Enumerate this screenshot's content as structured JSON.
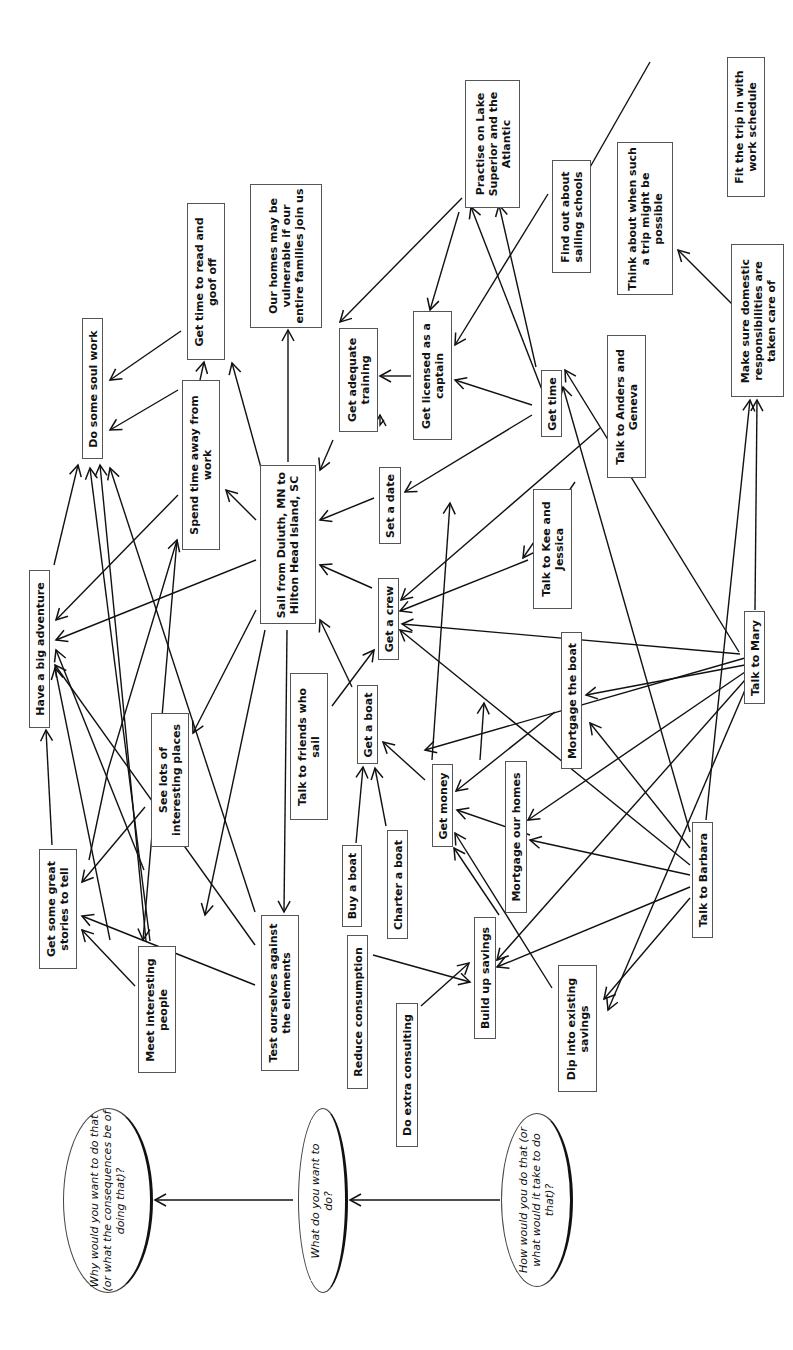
{
  "diagram": {
    "type": "means-ends goal map (rotated 90 degrees)",
    "legend": [
      {
        "id": "q_why",
        "text": "Why would you want to do that (or what the consequences be of doing that)?",
        "box": [
          63,
          1108,
          90,
          185
        ],
        "wrap": 185
      },
      {
        "id": "q_what",
        "text": "What do you want to do?",
        "box": [
          298,
          1108,
          50,
          185
        ],
        "wrap": 120
      },
      {
        "id": "q_how",
        "text": "How would you do that (or what would it take to do that)?",
        "box": [
          501,
          1113,
          72,
          174
        ],
        "wrap": 150
      }
    ],
    "nodes": [
      {
        "id": "adventure",
        "text": "Have a big adventure",
        "box": [
          29,
          570,
          21,
          158
        ],
        "wrap": 160
      },
      {
        "id": "soul",
        "text": "Do some soul work",
        "box": [
          82,
          318,
          21,
          141
        ],
        "wrap": 140
      },
      {
        "id": "read",
        "text": "Get time to read and goof off",
        "box": [
          187,
          203,
          38,
          157
        ],
        "wrap": 140
      },
      {
        "id": "homes_vuln",
        "text": "Our homes may be vulnerable if our entire families join us",
        "box": [
          250,
          184,
          72,
          144
        ],
        "wrap": 140
      },
      {
        "id": "away",
        "text": "Spend time away from work",
        "box": [
          182,
          380,
          38,
          170
        ],
        "wrap": 160
      },
      {
        "id": "sail",
        "text": "Sail from Duluth, MN to Hilton Head Island, SC",
        "box": [
          260,
          465,
          56,
          159
        ],
        "wrap": 150
      },
      {
        "id": "training",
        "text": "Get adequate training",
        "box": [
          339,
          328,
          39,
          104
        ],
        "wrap": 95
      },
      {
        "id": "practise",
        "text": "Practise on Lake Superior and the Atlantic",
        "box": [
          465,
          80,
          55,
          128
        ],
        "wrap": 125
      },
      {
        "id": "schools",
        "text": "Find out about sailing schools",
        "box": [
          552,
          160,
          39,
          113
        ],
        "wrap": 110
      },
      {
        "id": "think",
        "text": "Think about when such a trip might be possible",
        "box": [
          617,
          142,
          56,
          153
        ],
        "wrap": 145
      },
      {
        "id": "fit",
        "text": "Fit the trip in with work schedule",
        "box": [
          727,
          57,
          38,
          140
        ],
        "wrap": 130
      },
      {
        "id": "domestic",
        "text": "Make sure domestic responsibilities are taken care of",
        "box": [
          731,
          244,
          53,
          153
        ],
        "wrap": 145
      },
      {
        "id": "licensed",
        "text": "Get licensed as a captain",
        "box": [
          413,
          311,
          39,
          129
        ],
        "wrap": 110
      },
      {
        "id": "time",
        "text": "Get time",
        "box": [
          541,
          370,
          21,
          67
        ],
        "wrap": 65
      },
      {
        "id": "date",
        "text": "Set a date",
        "box": [
          379,
          467,
          22,
          77
        ],
        "wrap": 75
      },
      {
        "id": "anders",
        "text": "Talk to Anders and Geneva",
        "box": [
          607,
          335,
          39,
          143
        ],
        "wrap": 130
      },
      {
        "id": "kee",
        "text": "Talk to Kee and Jessica",
        "box": [
          533,
          489,
          39,
          120
        ],
        "wrap": 110
      },
      {
        "id": "crew",
        "text": "Get a crew",
        "box": [
          378,
          578,
          21,
          82
        ],
        "wrap": 80
      },
      {
        "id": "friends",
        "text": "Talk to friends who sail",
        "box": [
          290,
          673,
          38,
          147
        ],
        "wrap": 130
      },
      {
        "id": "boat",
        "text": "Get a boat",
        "box": [
          357,
          685,
          21,
          79
        ],
        "wrap": 78
      },
      {
        "id": "mort_boat",
        "text": "Mortgage the boat",
        "box": [
          561,
          632,
          21,
          137
        ],
        "wrap": 135
      },
      {
        "id": "mary",
        "text": "Talk to Mary",
        "box": [
          744,
          611,
          21,
          93
        ],
        "wrap": 90
      },
      {
        "id": "money",
        "text": "Get money",
        "box": [
          432,
          764,
          21,
          83
        ],
        "wrap": 80
      },
      {
        "id": "mort_homes",
        "text": "Mortgage our homes",
        "box": [
          505,
          761,
          22,
          152
        ],
        "wrap": 150
      },
      {
        "id": "buy",
        "text": "Buy a boat",
        "box": [
          342,
          845,
          20,
          82
        ],
        "wrap": 80
      },
      {
        "id": "charter",
        "text": "Charter a boat",
        "box": [
          387,
          830,
          21,
          109
        ],
        "wrap": 108
      },
      {
        "id": "reduce",
        "text": "Reduce consumption",
        "box": [
          347,
          935,
          21,
          154
        ],
        "wrap": 152
      },
      {
        "id": "savings",
        "text": "Build up savings",
        "box": [
          474,
          917,
          22,
          122
        ],
        "wrap": 120
      },
      {
        "id": "consult",
        "text": "Do extra consulting",
        "box": [
          396,
          1003,
          22,
          144
        ],
        "wrap": 142
      },
      {
        "id": "dip",
        "text": "Dip into existing savings",
        "box": [
          558,
          965,
          39,
          127
        ],
        "wrap": 125
      },
      {
        "id": "barbara",
        "text": "Talk to Barbara",
        "box": [
          692,
          822,
          21,
          116
        ],
        "wrap": 115
      },
      {
        "id": "stories",
        "text": "Get some great stories to tell",
        "box": [
          39,
          849,
          38,
          120
        ],
        "wrap": 118
      },
      {
        "id": "places",
        "text": "See lots of interesting places",
        "box": [
          151,
          713,
          38,
          134
        ],
        "wrap": 130
      },
      {
        "id": "people",
        "text": "Meet interesting people",
        "box": [
          138,
          946,
          38,
          127
        ],
        "wrap": 125
      },
      {
        "id": "test",
        "text": "Test ourselves against the elements",
        "box": [
          261,
          915,
          38,
          156
        ],
        "wrap": 155
      }
    ],
    "edges": [
      [
        [
          293,
          1200
        ],
        [
          155,
          1200
        ]
      ],
      [
        [
          500,
          1200
        ],
        [
          350,
          1200
        ]
      ],
      [
        [
          181,
          331
        ],
        [
          110,
          380
        ]
      ],
      [
        [
          178,
          390
        ],
        [
          110,
          430
        ]
      ],
      [
        [
          178,
          495
        ],
        [
          56,
          620
        ]
      ],
      [
        [
          54,
          565
        ],
        [
          78,
          465
        ]
      ],
      [
        [
          200,
          380
        ],
        [
          204,
          362
        ]
      ],
      [
        [
          263,
          475
        ],
        [
          232,
          363
        ]
      ],
      [
        [
          256,
          520
        ],
        [
          226,
          490
        ]
      ],
      [
        [
          288,
          462
        ],
        [
          288,
          330
        ]
      ],
      [
        [
          256,
          560
        ],
        [
          56,
          640
        ]
      ],
      [
        [
          256,
          610
        ],
        [
          193,
          733
        ]
      ],
      [
        [
          265,
          630
        ],
        [
          205,
          915
        ]
      ],
      [
        [
          287,
          630
        ],
        [
          284,
          912
        ]
      ],
      [
        [
          333,
          440
        ],
        [
          320,
          470
        ]
      ],
      [
        [
          374,
          498
        ],
        [
          320,
          520
        ]
      ],
      [
        [
          372,
          588
        ],
        [
          320,
          565
        ]
      ],
      [
        [
          352,
          687
        ],
        [
          320,
          620
        ]
      ],
      [
        [
          332,
          706
        ],
        [
          374,
          650
        ]
      ],
      [
        [
          384,
          420
        ],
        [
          380,
          425
        ],
        [
          380,
          415
        ]
      ],
      [
        [
          411,
          376
        ],
        [
          380,
          376
        ]
      ],
      [
        [
          459,
          212
        ],
        [
          430,
          310
        ]
      ],
      [
        [
          462,
          198
        ],
        [
          340,
          322
        ]
      ],
      [
        [
          548,
          194
        ],
        [
          455,
          345
        ]
      ],
      [
        [
          536,
          367
        ],
        [
          499,
          205
        ]
      ],
      [
        [
          532,
          405
        ],
        [
          455,
          380
        ]
      ],
      [
        [
          532,
          415
        ],
        [
          405,
          492
        ]
      ],
      [
        [
          575,
          482
        ],
        [
          523,
          558
        ]
      ],
      [
        [
          650,
          62
        ],
        [
          577,
          190
        ]
      ],
      [
        [
          733,
          305
        ],
        [
          678,
          250
        ]
      ],
      [
        [
          551,
          413
        ],
        [
          471,
          207
        ]
      ],
      [
        [
          600,
          428
        ],
        [
          401,
          600
        ]
      ],
      [
        [
          528,
          560
        ],
        [
          400,
          611
        ]
      ],
      [
        [
          740,
          654
        ],
        [
          402,
          624
        ]
      ],
      [
        [
          739,
          652
        ],
        [
          565,
          370
        ]
      ],
      [
        [
          745,
          658
        ],
        [
          425,
          750
        ]
      ],
      [
        [
          745,
          665
        ],
        [
          586,
          695
        ]
      ],
      [
        [
          745,
          672
        ],
        [
          528,
          820
        ]
      ],
      [
        [
          745,
          680
        ],
        [
          497,
          960
        ]
      ],
      [
        [
          745,
          690
        ],
        [
          608,
          1010
        ]
      ],
      [
        [
          755,
          610
        ],
        [
          757,
          400
        ]
      ],
      [
        [
          706,
          820
        ],
        [
          750,
          400
        ]
      ],
      [
        [
          690,
          832
        ],
        [
          563,
          387
        ]
      ],
      [
        [
          690,
          848
        ],
        [
          590,
          723
        ]
      ],
      [
        [
          690,
          865
        ],
        [
          400,
          630
        ]
      ],
      [
        [
          690,
          875
        ],
        [
          530,
          840
        ]
      ],
      [
        [
          690,
          887
        ],
        [
          497,
          967
        ]
      ],
      [
        [
          690,
          898
        ],
        [
          604,
          999
        ]
      ],
      [
        [
          552,
          988
        ],
        [
          455,
          833
        ]
      ],
      [
        [
          499,
          915
        ],
        [
          454,
          848
        ]
      ],
      [
        [
          480,
          760
        ],
        [
          484,
          703
        ]
      ],
      [
        [
          432,
          760
        ],
        [
          450,
          503
        ]
      ],
      [
        [
          425,
          780
        ],
        [
          383,
          742
        ]
      ],
      [
        [
          555,
          712
        ],
        [
          456,
          791
        ]
      ],
      [
        [
          530,
          835
        ],
        [
          457,
          810
        ]
      ],
      [
        [
          356,
          843
        ],
        [
          363,
          767
        ]
      ],
      [
        [
          386,
          826
        ],
        [
          375,
          768
        ]
      ],
      [
        [
          373,
          955
        ],
        [
          470,
          982
        ]
      ],
      [
        [
          421,
          1006
        ],
        [
          469,
          963
        ]
      ],
      [
        [
          52,
          845
        ],
        [
          46,
          730
        ]
      ],
      [
        [
          146,
          941
        ],
        [
          100,
          465
        ]
      ],
      [
        [
          150,
          941
        ],
        [
          90,
          468
        ]
      ],
      [
        [
          135,
          986
        ],
        [
          82,
          930
        ]
      ],
      [
        [
          255,
          985
        ],
        [
          82,
          916
        ]
      ],
      [
        [
          255,
          912
        ],
        [
          110,
          468
        ]
      ],
      [
        [
          255,
          945
        ],
        [
          55,
          665
        ]
      ],
      [
        [
          145,
          807
        ],
        [
          82,
          882
        ]
      ],
      [
        [
          110,
          940
        ],
        [
          55,
          668
        ]
      ],
      [
        [
          89,
          860
        ],
        [
          108,
          770
        ],
        [
          177,
          540
        ]
      ],
      [
        [
          144,
          870
        ],
        [
          56,
          650
        ]
      ],
      [
        [
          177,
          540
        ],
        [
          143,
          940
        ]
      ]
    ]
  }
}
